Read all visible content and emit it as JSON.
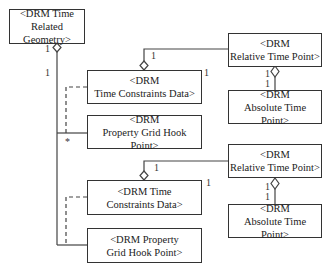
{
  "diagram": {
    "type": "UML class diagram (aggregation)",
    "boxes": {
      "time_related_geometry": {
        "line1": "<DRM Time",
        "line2": "Related Geometry>"
      },
      "relative_time_point_1": {
        "line1": "<DRM",
        "line2": "Relative Time Point>"
      },
      "absolute_time_point_1": {
        "line1": "<DRM",
        "line2": "Absolute Time Point>"
      },
      "time_constraints_data_1": {
        "line1": "<DRM",
        "line2": "Time Constraints Data>"
      },
      "property_grid_hook_point_1": {
        "line1": "<DRM",
        "line2": "Property Grid Hook Point>"
      },
      "relative_time_point_2": {
        "line1": "<DRM",
        "line2": "Relative Time Point>"
      },
      "absolute_time_point_2": {
        "line1": "<DRM",
        "line2": "Absolute Time Point>"
      },
      "time_constraints_data_2": {
        "line1": "<DRM Time",
        "line2": "Constraints Data>"
      },
      "property_grid_hook_point_2": {
        "line1": "<DRM Property",
        "line2": "Grid Hook Point>"
      }
    },
    "multiplicities": {
      "geometry_owner": "1",
      "geometry_left": "1",
      "star": "*",
      "tcd1_rel": "1",
      "tcd1_corner": "1",
      "rtp1_owner": "1",
      "rtp1_part": "1",
      "tcd2_rel": "1",
      "tcd2_corner": "1",
      "rtp2_owner": "1",
      "rtp2_part": "1"
    }
  }
}
